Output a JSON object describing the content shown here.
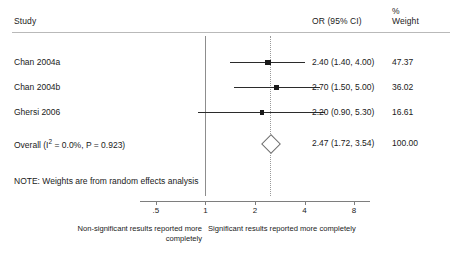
{
  "header": {
    "study_label": "Study",
    "or_label": "OR (95% CI)",
    "percent_label": "%",
    "weight_label": "Weight"
  },
  "chart_data": {
    "type": "forest",
    "title": "",
    "xlabel": "",
    "ylabel": "",
    "x_scale": "log",
    "xlim": [
      0.4,
      10
    ],
    "tick_values": [
      0.5,
      1,
      2,
      4,
      8
    ],
    "tick_labels": [
      ".5",
      "1",
      "2",
      "4",
      "8"
    ],
    "null_value": 1,
    "pooled_line_value": 2.47,
    "grid": false,
    "legend": "none",
    "columns": [
      "Study",
      "OR (95% CI)",
      "% Weight"
    ],
    "rows": [
      {
        "study": "Chan 2004a",
        "or_text": "2.40 (1.40, 4.00)",
        "weight_text": "47.37",
        "estimate": 2.4,
        "ci_low": 1.4,
        "ci_high": 4.0,
        "weight": 47.37,
        "marker": "square"
      },
      {
        "study": "Chan 2004b",
        "or_text": "2.70 (1.50, 5.00)",
        "weight_text": "36.02",
        "estimate": 2.7,
        "ci_low": 1.5,
        "ci_high": 5.0,
        "weight": 36.02,
        "marker": "square"
      },
      {
        "study": "Ghersi 2006",
        "or_text": "2.20 (0.90, 5.30)",
        "weight_text": "16.61",
        "estimate": 2.2,
        "ci_low": 0.9,
        "ci_high": 5.3,
        "weight": 16.61,
        "marker": "square"
      }
    ],
    "overall": {
      "study": "Overall (I2 = 0.0%, P = 0.923)",
      "label_prefix": "Overall (I",
      "label_sup": "2",
      "label_suffix": " = 0.0%, P = 0.923)",
      "or_text": "2.47 (1.72, 3.54)",
      "weight_text": "100.00",
      "estimate": 2.47,
      "ci_low": 1.72,
      "ci_high": 3.54,
      "weight": 100.0,
      "marker": "diamond",
      "heterogeneity_i2": "0.0%",
      "heterogeneity_p": "0.923"
    },
    "note": "NOTE: Weights are from random effects analysis",
    "footer_left": "Non-significant results reported more completely",
    "footer_right": "Significant results reported more completely"
  },
  "colors": {
    "marker": "#1a1a1a",
    "ci": "#2b2b2b",
    "null_line": "#8d8d8d",
    "pooled_line": "#9a9a9a",
    "diamond_stroke": "#6f6f6f",
    "axis": "#7e7e7e",
    "rule": "#b9b9b9",
    "text": "#1a1a1a",
    "background": "#ffffff"
  }
}
